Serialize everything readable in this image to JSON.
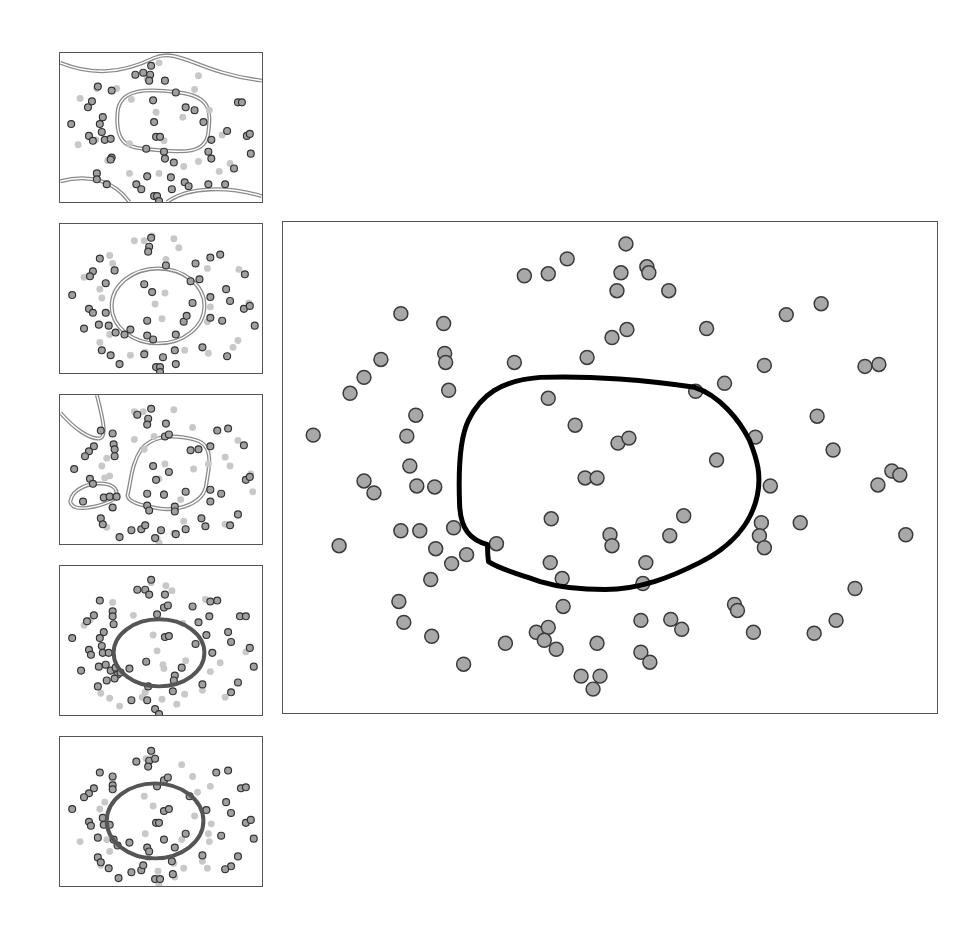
{
  "figure": {
    "colors": {
      "background": "#ffffff",
      "panel_border": "#555555",
      "point_fill": "#a8a8a8",
      "point_stroke": "#3a3a3a",
      "faded_point": "#c4c4c4",
      "boundary_double": "#8a8a8a",
      "boundary_main": "#000000",
      "boundary_dark": "#555555"
    }
  },
  "chart_data": [
    {
      "type": "scatter",
      "title": "",
      "panel": "thumbnail-1",
      "boundary": "double-line grey; central rounded-rectangle region plus wavy curves near top and bottom edges",
      "xlabel": "",
      "ylabel": "",
      "grid": false,
      "legend": null
    },
    {
      "type": "scatter",
      "title": "",
      "panel": "thumbnail-2",
      "boundary": "double-line grey ellipse, centered slightly left",
      "xlabel": "",
      "ylabel": "",
      "grid": false,
      "legend": null
    },
    {
      "type": "scatter",
      "title": "",
      "panel": "thumbnail-3",
      "boundary": "double-line grey; irregular central region, small ellipse lower-left, loop at upper-left corner",
      "xlabel": "",
      "ylabel": "",
      "grid": false,
      "legend": null
    },
    {
      "type": "scatter",
      "title": "",
      "panel": "thumbnail-4",
      "boundary": "solid dark-grey ellipse",
      "xlabel": "",
      "ylabel": "",
      "grid": false,
      "legend": null
    },
    {
      "type": "scatter",
      "title": "",
      "panel": "thumbnail-5",
      "boundary": "solid dark-grey ellipse",
      "xlabel": "",
      "ylabel": "",
      "grid": false,
      "legend": null
    },
    {
      "type": "scatter",
      "title": "",
      "panel": "main",
      "boundary": "thick solid black closed curve (rounded irregular blob) in center",
      "xlabel": "",
      "ylabel": "",
      "grid": false,
      "legend": null,
      "points_px": [
        [
          626,
          243
        ],
        [
          524,
          275
        ],
        [
          548,
          273
        ],
        [
          567,
          258
        ],
        [
          621,
          272
        ],
        [
          647,
          266
        ],
        [
          649,
          272
        ],
        [
          617,
          290
        ],
        [
          669,
          290
        ],
        [
          400,
          313
        ],
        [
          443,
          323
        ],
        [
          444,
          353
        ],
        [
          445,
          362
        ],
        [
          448,
          390
        ],
        [
          380,
          359
        ],
        [
          363,
          377
        ],
        [
          349,
          393
        ],
        [
          312,
          435
        ],
        [
          514,
          362
        ],
        [
          587,
          357
        ],
        [
          612,
          337
        ],
        [
          627,
          329
        ],
        [
          707,
          328
        ],
        [
          787,
          314
        ],
        [
          822,
          303
        ],
        [
          765,
          365
        ],
        [
          866,
          366
        ],
        [
          880,
          364
        ],
        [
          725,
          383
        ],
        [
          696,
          391
        ],
        [
          548,
          398
        ],
        [
          575,
          425
        ],
        [
          618,
          443
        ],
        [
          629,
          438
        ],
        [
          415,
          415
        ],
        [
          406,
          436
        ],
        [
          409,
          466
        ],
        [
          416,
          486
        ],
        [
          363,
          481
        ],
        [
          373,
          493
        ],
        [
          434,
          487
        ],
        [
          756,
          437
        ],
        [
          818,
          416
        ],
        [
          834,
          450
        ],
        [
          717,
          460
        ],
        [
          585,
          478
        ],
        [
          597,
          478
        ],
        [
          771,
          486
        ],
        [
          879,
          485
        ],
        [
          893,
          471
        ],
        [
          901,
          475
        ],
        [
          551,
          519
        ],
        [
          610,
          535
        ],
        [
          612,
          546
        ],
        [
          670,
          536
        ],
        [
          684,
          516
        ],
        [
          762,
          523
        ],
        [
          760,
          536
        ],
        [
          765,
          548
        ],
        [
          801,
          523
        ],
        [
          907,
          535
        ],
        [
          400,
          531
        ],
        [
          419,
          531
        ],
        [
          453,
          528
        ],
        [
          466,
          555
        ],
        [
          496,
          544
        ],
        [
          435,
          549
        ],
        [
          451,
          564
        ],
        [
          338,
          546
        ],
        [
          550,
          563
        ],
        [
          562,
          579
        ],
        [
          646,
          563
        ],
        [
          643,
          584
        ],
        [
          430,
          580
        ],
        [
          398,
          602
        ],
        [
          403,
          623
        ],
        [
          431,
          637
        ],
        [
          463,
          665
        ],
        [
          505,
          644
        ],
        [
          536,
          633
        ],
        [
          548,
          628
        ],
        [
          544,
          641
        ],
        [
          556,
          650
        ],
        [
          563,
          607
        ],
        [
          597,
          644
        ],
        [
          581,
          677
        ],
        [
          600,
          677
        ],
        [
          593,
          690
        ],
        [
          641,
          621
        ],
        [
          671,
          620
        ],
        [
          682,
          630
        ],
        [
          641,
          653
        ],
        [
          650,
          663
        ],
        [
          735,
          605
        ],
        [
          738,
          611
        ],
        [
          754,
          633
        ],
        [
          815,
          634
        ],
        [
          837,
          621
        ],
        [
          856,
          589
        ]
      ]
    }
  ]
}
